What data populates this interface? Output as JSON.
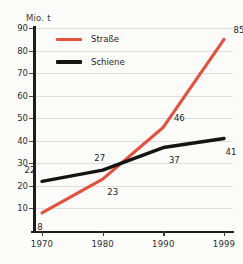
{
  "chart_data": {
    "type": "line",
    "title": "",
    "xlabel": "",
    "ylabel": "Mio. t",
    "x": [
      "1970",
      "1980",
      "1990",
      "1999"
    ],
    "xlim": [
      1970,
      1999
    ],
    "ylim": [
      0,
      90
    ],
    "grid": true,
    "legend_position": "top-left",
    "y_ticks": [
      "0",
      "10",
      "20",
      "30",
      "40",
      "50",
      "60",
      "70",
      "80",
      "90"
    ],
    "series": [
      {
        "name": "Straße",
        "color": "#e2523c",
        "values": [
          8,
          23,
          46,
          85
        ],
        "point_labels": [
          "8",
          "23",
          "46",
          "85"
        ]
      },
      {
        "name": "Schiene",
        "color": "#141414",
        "values": [
          22,
          27,
          37,
          41
        ],
        "point_labels": [
          "22",
          "27",
          "37",
          "41"
        ]
      }
    ]
  },
  "axis": {
    "unit_label": "Mio. t"
  },
  "legend": {
    "items": [
      {
        "label": "Straße",
        "color": "#e2523c"
      },
      {
        "label": "Schiene",
        "color": "#141414"
      }
    ]
  },
  "colors": {
    "background": "#fbfbfa",
    "grid": "#dedede",
    "axis": "#1c1c1c",
    "strasse": "#e2523c",
    "schiene": "#141414",
    "text": "#2f2f2f"
  }
}
